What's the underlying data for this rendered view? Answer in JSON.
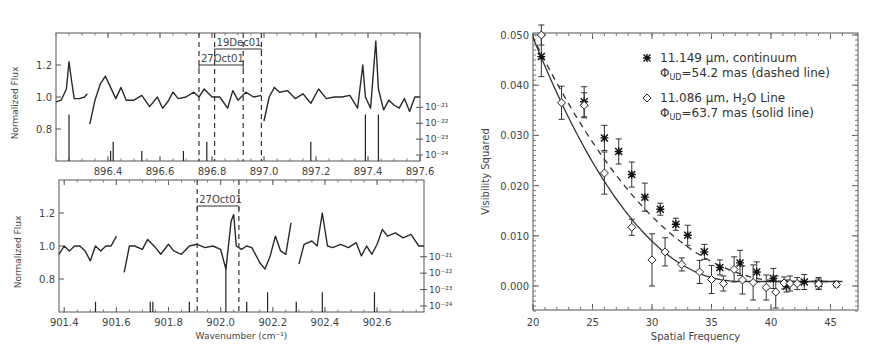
{
  "chart_data": [
    {
      "type": "line",
      "panel": "top-left spectrum",
      "xlabel": "",
      "ylabel": "Normalized Flux",
      "xlim": [
        896.2,
        897.6
      ],
      "ylim": [
        0.6,
        1.4
      ],
      "x_ticks": [
        "896.4",
        "896.6",
        "896.8",
        "897.0",
        "897.2",
        "897.4",
        "897.6"
      ],
      "y_ticks": [
        "0.8",
        "1.0",
        "1.2"
      ],
      "right_axis_ticks": [
        "10⁻²¹",
        "10⁻²²",
        "10⁻²³",
        "10⁻²⁴"
      ],
      "annotations": [
        {
          "label": "19Dec01",
          "x_range": [
            896.81,
            896.99
          ]
        },
        {
          "label": "27Oct01",
          "x_range": [
            896.75,
            896.92
          ]
        }
      ],
      "dashed_lines_x": [
        896.75,
        896.81,
        896.92,
        896.99
      ],
      "line_segments": [
        {
          "x": [
            896.2,
            896.22,
            896.24,
            896.25,
            896.26,
            896.27,
            896.29,
            896.31,
            896.32
          ],
          "y": [
            0.97,
            0.98,
            1.05,
            1.22,
            1.1,
            0.99,
            0.99,
            1.0,
            1.02
          ]
        },
        {
          "x": [
            896.33,
            896.35,
            896.37,
            896.39,
            896.41,
            896.43,
            896.45,
            896.47,
            896.5,
            896.53,
            896.56,
            896.59,
            896.61,
            896.63,
            896.65,
            896.67,
            896.7,
            896.73,
            896.75,
            896.77,
            896.8,
            896.83,
            896.86,
            896.88,
            896.9,
            896.93,
            896.96,
            896.99
          ],
          "y": [
            0.83,
            0.98,
            1.08,
            1.13,
            1.06,
            0.99,
            1.06,
            0.98,
            0.98,
            1.01,
            0.94,
            1.0,
            0.93,
            0.97,
            1.03,
            0.99,
            1.0,
            1.03,
            1.0,
            1.05,
            1.0,
            1.0,
            0.93,
            1.04,
            0.98,
            1.03,
            1.0,
            1.01
          ]
        },
        {
          "x": [
            897.0,
            897.02,
            897.04,
            897.06,
            897.09,
            897.12,
            897.15,
            897.18,
            897.21,
            897.24,
            897.27,
            897.3,
            897.33,
            897.36,
            897.38,
            897.39,
            897.41,
            897.43,
            897.44,
            897.46,
            897.48,
            897.5,
            897.52,
            897.54,
            897.56,
            897.58,
            897.6
          ],
          "y": [
            0.85,
            1.0,
            1.06,
            1.03,
            1.04,
            0.99,
            1.02,
            0.96,
            1.05,
            0.99,
            1.0,
            1.0,
            1.01,
            0.93,
            1.2,
            1.0,
            0.93,
            1.35,
            1.05,
            0.92,
            0.98,
            0.95,
            0.93,
            0.99,
            0.91,
            1.0,
            1.0
          ]
        }
      ],
      "stick_lines": [
        {
          "x": 896.25,
          "height": "tall"
        },
        {
          "x": 896.41,
          "height": "short"
        },
        {
          "x": 896.42,
          "height": "medium"
        },
        {
          "x": 896.53,
          "height": "short"
        },
        {
          "x": 896.69,
          "height": "short"
        },
        {
          "x": 896.78,
          "height": "medium"
        },
        {
          "x": 897.18,
          "height": "medium"
        },
        {
          "x": 897.39,
          "height": "tall"
        },
        {
          "x": 897.44,
          "height": "tall"
        }
      ]
    },
    {
      "type": "line",
      "panel": "bottom-left spectrum",
      "xlabel": "Wavenumber (cm⁻¹)",
      "ylabel": "Normalized Flux",
      "xlim": [
        901.38,
        902.78
      ],
      "ylim": [
        0.6,
        1.4
      ],
      "x_ticks": [
        "901.4",
        "901.6",
        "901.8",
        "902.0",
        "902.2",
        "902.4",
        "902.6"
      ],
      "y_ticks": [
        "0.8",
        "1.0",
        "1.2"
      ],
      "right_axis_ticks": [
        "10⁻²¹",
        "10⁻²²",
        "10⁻²³",
        "10⁻²⁴"
      ],
      "annotations": [
        {
          "label": "27Oct01",
          "x_range": [
            901.91,
            902.07
          ]
        }
      ],
      "dashed_lines_x": [
        901.91,
        902.07
      ],
      "line_segments": [
        {
          "x": [
            901.38,
            901.4,
            901.42,
            901.44,
            901.46,
            901.48,
            901.5,
            901.52,
            901.54,
            901.56,
            901.58,
            901.6
          ],
          "y": [
            0.95,
            1.0,
            0.97,
            1.0,
            1.0,
            0.97,
            0.91,
            1.0,
            0.97,
            1.0,
            1.0,
            1.06
          ]
        },
        {
          "x": [
            901.63,
            901.65,
            901.67,
            901.7,
            901.72,
            901.75,
            901.77,
            901.8,
            901.82,
            901.85,
            901.88,
            901.91,
            901.94,
            901.97,
            902.0,
            902.02,
            902.04,
            902.05,
            902.06,
            902.08,
            902.1,
            902.12,
            902.15,
            902.17,
            902.19,
            902.21,
            902.23,
            902.25,
            902.27
          ],
          "y": [
            0.84,
            1.0,
            1.0,
            0.98,
            1.04,
            0.99,
            0.95,
            1.01,
            0.97,
            0.95,
            1.0,
            1.01,
            0.99,
            1.0,
            0.98,
            0.86,
            1.15,
            1.19,
            1.0,
            0.98,
            1.0,
            0.99,
            0.9,
            0.86,
            0.94,
            1.06,
            0.97,
            0.95,
            1.14
          ]
        },
        {
          "x": [
            902.3,
            902.32,
            902.35,
            902.37,
            902.39,
            902.41,
            902.43,
            902.46,
            902.49,
            902.52,
            902.54,
            902.56,
            902.58,
            902.6,
            902.62,
            902.64,
            902.67,
            902.7,
            902.73,
            902.76,
            902.78
          ],
          "y": [
            0.89,
            1.01,
            1.03,
            1.0,
            1.2,
            1.0,
            0.99,
            1.01,
            0.99,
            1.02,
            0.94,
            1.0,
            0.95,
            1.01,
            1.1,
            1.06,
            1.08,
            1.05,
            1.07,
            1.0,
            1.0
          ]
        }
      ],
      "stick_lines": [
        {
          "x": 901.52,
          "height": "short"
        },
        {
          "x": 901.73,
          "height": "short"
        },
        {
          "x": 901.74,
          "height": "short"
        },
        {
          "x": 901.88,
          "height": "short"
        },
        {
          "x": 902.02,
          "height": "tall"
        },
        {
          "x": 902.1,
          "height": "short"
        },
        {
          "x": 902.18,
          "height": "medium"
        },
        {
          "x": 902.29,
          "height": "short"
        },
        {
          "x": 902.39,
          "height": "medium"
        },
        {
          "x": 902.59,
          "height": "medium"
        }
      ]
    },
    {
      "type": "scatter",
      "panel": "right visibility",
      "title": "",
      "xlabel": "Spatial Frequency",
      "ylabel": "Visibility Squared",
      "xlim": [
        20,
        46
      ],
      "ylim": [
        -0.005,
        0.05
      ],
      "x_ticks": [
        "20",
        "25",
        "30",
        "35",
        "40",
        "45"
      ],
      "y_ticks": [
        "0.000",
        "0.010",
        "0.020",
        "0.030",
        "0.040",
        "0.050"
      ],
      "legend": [
        {
          "marker": "asterisk",
          "line1": "11.149 μm, continuum",
          "line2": "ΦUD=54.2 mas (dashed line)"
        },
        {
          "marker": "diamond",
          "line1": "11.086 μm, H2O Line",
          "line2": "ΦUD=63.7 mas (solid line)"
        }
      ],
      "series": [
        {
          "name": "11.149 μm, continuum",
          "marker": "asterisk",
          "fit": "dashed",
          "x": [
            20.7,
            24.3,
            26.0,
            27.2,
            28.3,
            29.4,
            30.7,
            32.0,
            33.0,
            34.4,
            35.7,
            37.4,
            38.8,
            40.2,
            41.3,
            42.8,
            44.0
          ],
          "y": [
            0.0457,
            0.0367,
            0.0295,
            0.0268,
            0.0222,
            0.0177,
            0.0153,
            0.0123,
            0.0101,
            0.0068,
            0.0037,
            0.0046,
            0.0028,
            0.0015,
            0.0,
            0.0008,
            0.0005
          ],
          "err": [
            0.004,
            0.003,
            0.0025,
            0.0025,
            0.0025,
            0.0028,
            0.0012,
            0.0012,
            0.002,
            0.0015,
            0.0015,
            0.0025,
            0.002,
            0.002,
            0.0012,
            0.0015,
            0.0012
          ]
        },
        {
          "name": "11.086 μm, H2O Line",
          "marker": "diamond",
          "fit": "solid",
          "x": [
            20.7,
            22.4,
            24.3,
            26.0,
            28.3,
            30.0,
            31.1,
            32.5,
            34.0,
            35.0,
            36.0,
            36.9,
            37.6,
            38.5,
            39.6,
            40.4,
            41.1,
            41.6,
            42.2,
            44.0,
            45.5
          ],
          "y": [
            0.05,
            0.0365,
            0.036,
            0.0225,
            0.0117,
            0.0052,
            0.0068,
            0.0043,
            0.0028,
            0.0013,
            0.0005,
            0.0033,
            0.0012,
            0.0007,
            -0.0003,
            -0.0012,
            0.0006,
            0.0005,
            0.0005,
            0.0004,
            0.0003
          ],
          "err": [
            0.002,
            0.0033,
            0.0025,
            0.0042,
            0.0016,
            0.0052,
            0.0028,
            0.0013,
            0.0023,
            0.0028,
            0.0015,
            0.0025,
            0.0028,
            0.0035,
            0.0025,
            0.0032,
            0.0012,
            0.0015,
            0.0012,
            0.001,
            0.0005
          ]
        }
      ],
      "grid": false,
      "legend_position": "upper right"
    }
  ]
}
